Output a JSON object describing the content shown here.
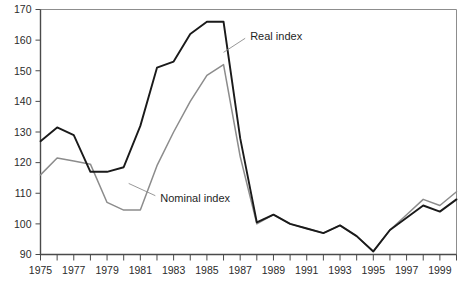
{
  "chart_data": {
    "type": "line",
    "title": "",
    "subtitle": "",
    "xlabel": "",
    "ylabel": "",
    "grid": false,
    "legend_position": "inline-annotations",
    "xlim": [
      1975,
      2000
    ],
    "ylim": [
      90,
      170
    ],
    "ytick_step": 10,
    "x": [
      1975,
      1976,
      1977,
      1978,
      1979,
      1980,
      1981,
      1982,
      1983,
      1984,
      1985,
      1986,
      1987,
      1988,
      1989,
      1990,
      1991,
      1992,
      1993,
      1994,
      1995,
      1996,
      1997,
      1998,
      1999,
      2000
    ],
    "xtick_labels": [
      "1975",
      "",
      "1977",
      "",
      "1979",
      "",
      "1981",
      "",
      "1983",
      "",
      "1985",
      "",
      "1987",
      "",
      "1989",
      "",
      "1991",
      "",
      "1993",
      "",
      "1995",
      "",
      "1997",
      "",
      "1999",
      ""
    ],
    "ytick_labels": [
      "90",
      "100",
      "110",
      "120",
      "130",
      "140",
      "150",
      "160",
      "170"
    ],
    "ytick_values": [
      90,
      100,
      110,
      120,
      130,
      140,
      150,
      160,
      170
    ],
    "series": [
      {
        "name": "Real index",
        "color": "#1a1a1a",
        "values": [
          127,
          131.5,
          129,
          117,
          117,
          118.5,
          132,
          151,
          153,
          162,
          166,
          166,
          128,
          100.5,
          103,
          100,
          98.5,
          97,
          99.5,
          96,
          91,
          98,
          102,
          106,
          104,
          108
        ]
      },
      {
        "name": "Nominal index",
        "color": "#8c8c8c",
        "values": [
          116,
          121.5,
          120.5,
          119.5,
          107,
          104.5,
          104.5,
          119,
          130,
          140,
          148.5,
          152,
          122,
          100,
          103,
          100,
          98.5,
          97,
          99.5,
          96,
          91,
          98,
          103,
          108,
          106,
          110.5
        ]
      }
    ],
    "annotations": [
      {
        "name": "real-index-label",
        "text": "Real index",
        "x": 1987.6,
        "y": 161.5
      },
      {
        "name": "nominal-index-label",
        "text": "Nominal index",
        "x": 1982.2,
        "y": 108.5
      }
    ]
  }
}
